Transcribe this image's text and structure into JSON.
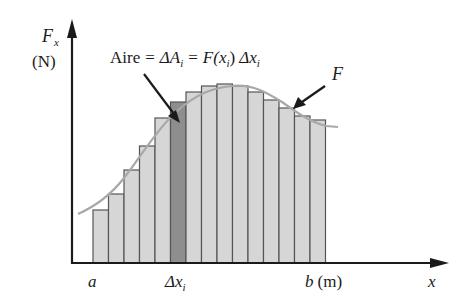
{
  "axes": {
    "y_label_main": "F",
    "y_label_sub": "x",
    "y_unit": "(N)",
    "x_label": "x"
  },
  "annotation": {
    "area_word": "Aire",
    "eq1": "=",
    "delta_a": "ΔA",
    "sub_i": "i",
    "eq2": "=",
    "fx": "F(x",
    "fx_sub": "i",
    "fx_close": ")",
    "delta_x": "Δx",
    "delta_x_sub": "i"
  },
  "curve_label": "F",
  "x_ticks": {
    "a": "a",
    "delta_x": "Δx",
    "delta_x_sub": "i",
    "b": "b",
    "b_unit": "(m)"
  },
  "colors": {
    "bar_fill": "#d6d6d6",
    "bar_highlight": "#8e8e8e",
    "bar_stroke": "#555555",
    "curve": "#a8a8a8",
    "axis": "#1a1a1a"
  },
  "chart_data": {
    "type": "bar",
    "xlabel": "x",
    "ylabel": "F_x (N)",
    "x_range_labels": [
      "a",
      "b (m)"
    ],
    "highlighted_bar_index": 5,
    "bar_tops_px": [
      210,
      194,
      170,
      146,
      118,
      102,
      92,
      86,
      84,
      86,
      92,
      100,
      108,
      116,
      120
    ],
    "note": "15 Riemann-sum rectangles under curve F; bar 6 (Δx_i) highlighted"
  }
}
